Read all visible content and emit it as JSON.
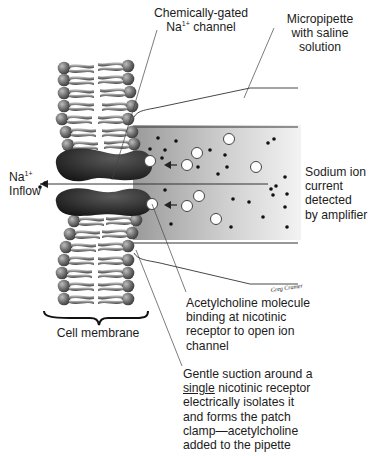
{
  "diagram": {
    "type": "patch-clamp illustration",
    "labels": {
      "channel": {
        "line1": "Chemically-gated",
        "line2_pre": "Na",
        "line2_sup": "1+",
        "line2_post": " channel"
      },
      "pipette": {
        "line1": "Micropipette",
        "line2": "with saline",
        "line3": "solution"
      },
      "inflow": {
        "line1_pre": "Na",
        "line1_sup": "1+",
        "line2": "Inflow"
      },
      "current": {
        "line1": "Sodium ion",
        "line2": "current",
        "line3": "detected",
        "line4": "by amplifier"
      },
      "membrane": {
        "text": "Cell membrane"
      },
      "acetylcholine": {
        "line1": "Acetylcholine molecule",
        "line2": "binding at nicotinic",
        "line3": "receptor to open ion",
        "line4": "channel"
      },
      "suction": {
        "line1": "Gentle suction around a",
        "line2_underlined": "single",
        "line2_rest": " nicotinic receptor",
        "line3": "electrically isolates it",
        "line4": "and forms the patch",
        "line5": "clamp—acetylcholine",
        "line6": "added to the pipette"
      },
      "signature": "Greg Cramer"
    },
    "colors": {
      "pipette_fill_light": "#f2f2f2",
      "pipette_fill_dark": "#a8a8a8",
      "channel_protein": "#2a2a2a",
      "phospholipid_head": "#6e6e6e",
      "line": "#333333"
    }
  }
}
